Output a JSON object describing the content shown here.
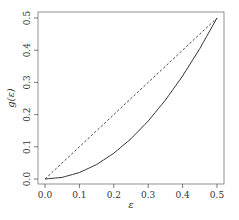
{
  "chart_data": {
    "type": "line",
    "title": "",
    "xlabel": "ε",
    "ylabel": "g(ε)",
    "xlim": [
      0.0,
      0.5
    ],
    "ylim": [
      0.0,
      0.5
    ],
    "grid": false,
    "legend": null,
    "x_ticks": [
      "0.0",
      "0.1",
      "0.2",
      "0.3",
      "0.4",
      "0.5"
    ],
    "y_ticks": [
      "0.0",
      "0.1",
      "0.2",
      "0.3",
      "0.4",
      "0.5"
    ],
    "series": [
      {
        "name": "g(ε)",
        "style": "solid",
        "x": [
          0.0,
          0.05,
          0.1,
          0.15,
          0.2,
          0.25,
          0.3,
          0.35,
          0.4,
          0.45,
          0.5
        ],
        "y": [
          0.0,
          0.005,
          0.02,
          0.045,
          0.08,
          0.125,
          0.18,
          0.245,
          0.32,
          0.405,
          0.5
        ]
      },
      {
        "name": "identity",
        "style": "dashed",
        "x": [
          0.0,
          0.5
        ],
        "y": [
          0.0,
          0.5
        ]
      }
    ]
  },
  "axes": {
    "x_label": "ε",
    "y_label": "g(ε)",
    "x_tick_labels": [
      "0.0",
      "0.1",
      "0.2",
      "0.3",
      "0.4",
      "0.5"
    ],
    "y_tick_labels": [
      "0.0",
      "0.1",
      "0.2",
      "0.3",
      "0.4",
      "0.5"
    ]
  }
}
